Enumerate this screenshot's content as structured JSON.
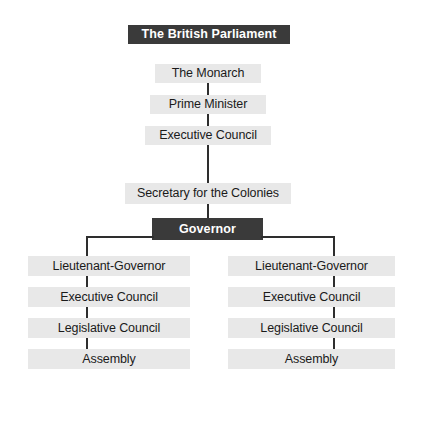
{
  "diagram": {
    "title": "The British Parliament",
    "colors": {
      "dark_box": "#3a3a3a",
      "light_box": "#e8e8e8",
      "connector": "#2e2e2e",
      "background": "#ffffff",
      "dark_text": "#ffffff",
      "light_text": "#1a1a1a"
    },
    "nodes": {
      "monarch": "The Monarch",
      "prime_minister": "Prime Minister",
      "executive_council_imperial": "Executive Council",
      "secretary_for_the_colonies": "Secretary for the Colonies",
      "governor": "Governor",
      "left_lieutenant_governor": "Lieutenant-Governor",
      "left_executive_council": "Executive Council",
      "left_legislative_council": "Legislative Council",
      "left_assembly": "Assembly",
      "right_lieutenant_governor": "Lieutenant-Governor",
      "right_executive_council": "Executive Council",
      "right_legislative_council": "Legislative Council",
      "right_assembly": "Assembly"
    }
  }
}
